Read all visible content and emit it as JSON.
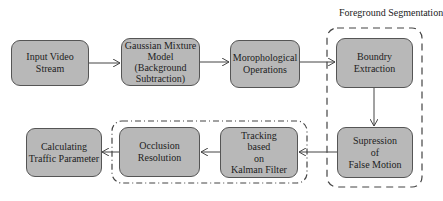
{
  "diagram": {
    "group_labels": {
      "foreground": "Foreground Segmentation"
    },
    "nodes": [
      {
        "id": "input",
        "lines": [
          "Input Video",
          "Stream"
        ]
      },
      {
        "id": "gmm",
        "lines": [
          "Gaussian Mixture",
          "Model",
          "(Background",
          "Subtraction)"
        ]
      },
      {
        "id": "morph",
        "lines": [
          "Morophological",
          "Operations"
        ]
      },
      {
        "id": "boundary",
        "lines": [
          "Boundry",
          "Extraction"
        ]
      },
      {
        "id": "suppress",
        "lines": [
          "Supression",
          "of",
          "False Motion"
        ]
      },
      {
        "id": "tracking",
        "lines": [
          "Tracking",
          "based",
          "on",
          "Kalman Filter"
        ]
      },
      {
        "id": "occlusion",
        "lines": [
          "Occlusion",
          "Resolution"
        ]
      },
      {
        "id": "calc",
        "lines": [
          "Calculating",
          "Traffic Parameter"
        ]
      }
    ],
    "edges": [
      [
        "input",
        "gmm"
      ],
      [
        "gmm",
        "morph"
      ],
      [
        "morph",
        "boundary"
      ],
      [
        "boundary",
        "suppress"
      ],
      [
        "suppress",
        "tracking"
      ],
      [
        "tracking",
        "occlusion"
      ],
      [
        "occlusion",
        "calc"
      ]
    ],
    "colors": {
      "box_fill": "#b8b8b8",
      "box_border": "#555555",
      "line": "#444444"
    }
  }
}
